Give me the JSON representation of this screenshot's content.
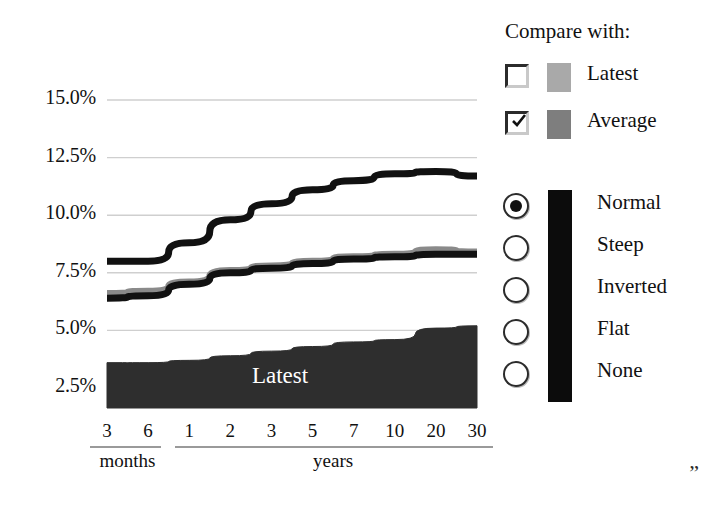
{
  "chart_data": {
    "type": "line",
    "title": "",
    "xlabel": "",
    "ylabel": "",
    "grid": true,
    "ylim": [
      1.25,
      16.25
    ],
    "ytick_labels": [
      "15.0%",
      "12.5%",
      "10.0%",
      "7.5%",
      "5.0%",
      "2.5%"
    ],
    "ytick_values": [
      15.0,
      12.5,
      10.0,
      7.5,
      5.0,
      2.5
    ],
    "categories": [
      "3",
      "6",
      "1",
      "2",
      "3",
      "5",
      "7",
      "10",
      "20",
      "30"
    ],
    "x_group_labels": [
      "months",
      "years"
    ],
    "series": [
      {
        "name": "Normal",
        "color": "#111111",
        "style": "line",
        "values": [
          8.0,
          8.0,
          8.8,
          9.8,
          10.5,
          11.1,
          11.5,
          11.8,
          11.9,
          11.7
        ]
      },
      {
        "name": "Average",
        "color": "#8a8a8a",
        "style": "line",
        "values": [
          6.6,
          6.7,
          7.1,
          7.6,
          7.8,
          8.0,
          8.2,
          8.3,
          8.5,
          8.4
        ]
      },
      {
        "name": "CurrentLow",
        "color": "#111111",
        "style": "line",
        "values": [
          6.4,
          6.5,
          7.0,
          7.5,
          7.7,
          7.9,
          8.1,
          8.2,
          8.3,
          8.3
        ]
      },
      {
        "name": "Latest",
        "color": "#2e2e2e",
        "style": "area",
        "values": [
          3.6,
          3.6,
          3.7,
          3.9,
          4.1,
          4.3,
          4.5,
          4.6,
          5.1,
          5.2
        ]
      }
    ],
    "area_label": "Latest",
    "area_label_color": "#ffffff"
  },
  "side_panel": {
    "compare_title": "Compare with:",
    "compare_options": [
      {
        "label": "Latest",
        "checked": false,
        "swatch": "#a9a9a9"
      },
      {
        "label": "Average",
        "checked": true,
        "swatch": "#7e7e7e"
      }
    ],
    "shape_options": [
      {
        "label": "Normal",
        "selected": true
      },
      {
        "label": "Steep",
        "selected": false
      },
      {
        "label": "Inverted",
        "selected": false
      },
      {
        "label": "Flat",
        "selected": false
      },
      {
        "label": "None",
        "selected": false
      }
    ],
    "mode_bar_color": "#0c0c0c"
  },
  "footer": {
    "trailing_quote": "”"
  }
}
